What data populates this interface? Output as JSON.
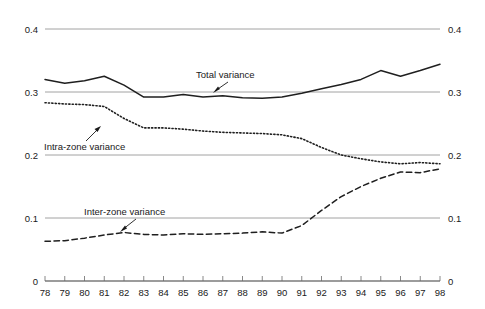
{
  "chart_data": {
    "type": "line",
    "title": "",
    "subtitle": "",
    "xlabel": "",
    "ylabel": "",
    "xlim": [
      78,
      98
    ],
    "ylim": [
      0,
      0.4
    ],
    "grid": true,
    "legend_position": "inline-annotations",
    "y_ticks": [
      "0",
      "0.1",
      "0.2",
      "0.3",
      "0.4"
    ],
    "y_tick_values": [
      0,
      0.1,
      0.2,
      0.3,
      0.4
    ],
    "y_axis_labels_both_sides": true,
    "x": [
      78,
      79,
      80,
      81,
      82,
      83,
      84,
      85,
      86,
      87,
      88,
      89,
      90,
      91,
      92,
      93,
      94,
      95,
      96,
      97,
      98
    ],
    "x_ticks": [
      "78",
      "79",
      "80",
      "81",
      "82",
      "83",
      "84",
      "85",
      "86",
      "87",
      "88",
      "89",
      "90",
      "91",
      "92",
      "93",
      "94",
      "95",
      "96",
      "97",
      "98"
    ],
    "series": [
      {
        "name": "Total variance",
        "style": "solid",
        "color": "#1f1f1f",
        "values": [
          0.32,
          0.314,
          0.318,
          0.325,
          0.311,
          0.292,
          0.292,
          0.296,
          0.292,
          0.294,
          0.291,
          0.29,
          0.292,
          0.298,
          0.305,
          0.312,
          0.32,
          0.334,
          0.325,
          0.334,
          0.344
        ]
      },
      {
        "name": "Intra-zone variance",
        "style": "dotted",
        "color": "#1f1f1f",
        "values": [
          0.283,
          0.281,
          0.28,
          0.277,
          0.258,
          0.243,
          0.243,
          0.241,
          0.238,
          0.236,
          0.235,
          0.234,
          0.232,
          0.226,
          0.212,
          0.2,
          0.194,
          0.189,
          0.186,
          0.188,
          0.186
        ]
      },
      {
        "name": "Inter-zone variance",
        "style": "dashed",
        "color": "#1f1f1f",
        "values": [
          0.063,
          0.064,
          0.068,
          0.073,
          0.077,
          0.074,
          0.073,
          0.075,
          0.074,
          0.075,
          0.076,
          0.078,
          0.076,
          0.088,
          0.112,
          0.134,
          0.15,
          0.163,
          0.173,
          0.172,
          0.178
        ]
      }
    ],
    "annotations": [
      {
        "label": "Total variance",
        "target_x": 87.0,
        "target_y": 0.291
      },
      {
        "label": "Intra-zone variance",
        "target_x": 81.7,
        "target_y": 0.272
      },
      {
        "label": "Inter-zone variance",
        "target_x": 81.6,
        "target_y": 0.0755
      }
    ]
  }
}
